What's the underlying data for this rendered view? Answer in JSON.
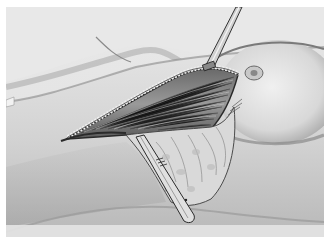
{
  "image": {
    "kind": "medical-illustration",
    "style": "grayscale pencil drawing",
    "subject": "surgical incision with retracted tissue exposing striated muscle; forceps above, scalpel below",
    "colors": {
      "background": "#ffffff",
      "canvas": "#e6e6e6",
      "skin_light": "#ececec",
      "skin_mid": "#cfcfcf",
      "shadow": "#8a8a8a",
      "muscle_dark": "#555555",
      "outline": "#2a2a2a"
    }
  }
}
